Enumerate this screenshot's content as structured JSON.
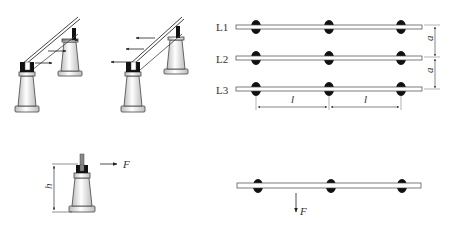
{
  "figures": {
    "fig_a": {
      "description": "insulators with busbar, forces pointing right"
    },
    "fig_b": {
      "description": "insulators with busbar, forces pointing left"
    },
    "fig_c": {
      "dimension_label": "h",
      "force_label": "F"
    },
    "fig_d": {
      "phase_labels": [
        "L1",
        "L2",
        "L3"
      ],
      "spacing_vertical_label": "a",
      "span_label": "l"
    },
    "fig_e": {
      "force_label": "F"
    }
  },
  "colors": {
    "line": "#333333",
    "insulator_fill": "#f2f2f2",
    "cap": "#111111"
  }
}
